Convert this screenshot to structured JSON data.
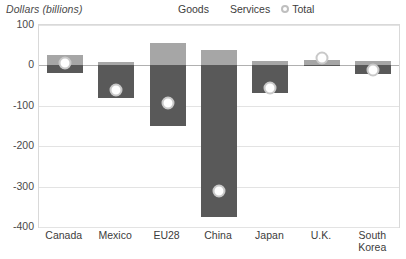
{
  "chart_data": {
    "type": "bar",
    "title": "Dollars (billions)",
    "xlabel": "",
    "ylabel": "Dollars (billions)",
    "categories": [
      "Canada",
      "Mexico",
      "EU28",
      "China",
      "Japan",
      "U.K.",
      "South\nKorea"
    ],
    "ylim": [
      -400,
      100
    ],
    "yticks": [
      100,
      0,
      -100,
      -200,
      -300,
      -400
    ],
    "ytick_labels": [
      "100",
      "0",
      "-100",
      "-200",
      "-300",
      "-400"
    ],
    "grid": true,
    "legend_position": "top-right",
    "series": [
      {
        "name": "Goods",
        "type": "bar",
        "color": "#595959",
        "values": [
          -18,
          -80,
          -150,
          -375,
          -68,
          -2,
          -22
        ]
      },
      {
        "name": "Services",
        "type": "bar",
        "color": "#a6a6a6",
        "values": [
          25,
          8,
          55,
          38,
          12,
          13,
          10
        ]
      },
      {
        "name": "Total",
        "type": "scatter",
        "color": "#ffffff",
        "marker_edge": "#c9c9c9",
        "values": [
          7,
          -62,
          -92,
          -310,
          -56,
          19,
          -12
        ]
      }
    ]
  },
  "legend": {
    "items": [
      {
        "label": "Goods",
        "glyph": "square-dark-icon"
      },
      {
        "label": "Services",
        "glyph": "square-light-icon"
      },
      {
        "label": "Total",
        "glyph": "circle-marker-icon"
      }
    ]
  },
  "colors": {
    "goods": "#595959",
    "services": "#a6a6a6",
    "total_fill": "#ffffff",
    "total_edge": "#c9c9c9",
    "grid": "#e3e3e3",
    "zero_axis": "#b0b0b0",
    "frame": "#d9d9d9",
    "text": "#3c3c3c",
    "title_text": "#4a4a4a"
  }
}
